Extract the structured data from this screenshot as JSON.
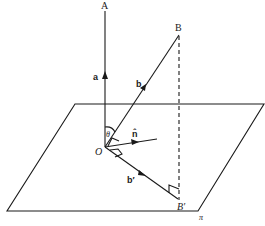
{
  "diagram": {
    "type": "vector-projection-onto-plane",
    "colors": {
      "ink": "#1a1a1a",
      "background": "#ffffff"
    },
    "points": {
      "A": {
        "label": "A"
      },
      "B": {
        "label": "B"
      },
      "O": {
        "label": "O"
      },
      "B_prime": {
        "label": "B′"
      }
    },
    "vectors": {
      "a": {
        "label": "a"
      },
      "b": {
        "label": "b"
      },
      "b_prime": {
        "label": "b′"
      },
      "n_hat": {
        "label": "n̂"
      }
    },
    "angle": {
      "label": "θ"
    },
    "plane": {
      "label": "π"
    }
  }
}
